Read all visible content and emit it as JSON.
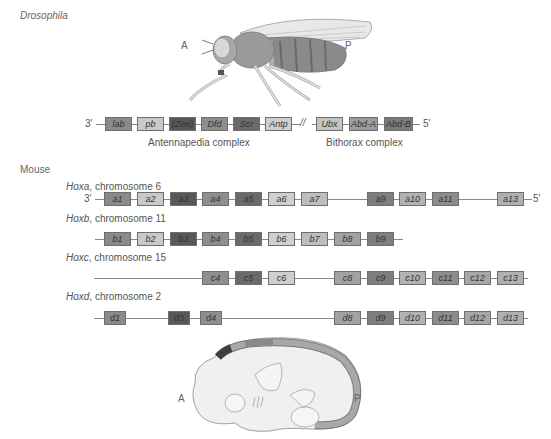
{
  "colors": {
    "lab": "#8a8a8a",
    "pb": "#c9c9c9",
    "zen": "#585858",
    "dfd": "#8e8e8e",
    "scr": "#6a6a6a",
    "antp": "#cfcfcf",
    "ubx": "#c4c4c4",
    "abdA": "#9c9c9c",
    "abdB": "#7a7a7a",
    "g1": "#8a8a8a",
    "g2": "#c9c9c9",
    "g3": "#585858",
    "g4": "#8e8e8e",
    "g5": "#6a6a6a",
    "g6": "#cfcfcf",
    "g7": "#bdbdbd",
    "g8": "#a2a2a2",
    "g9": "#7e7e7e",
    "g10": "#b2b2b2",
    "g11": "#8c8c8c",
    "g12": "#a6a6a6",
    "g13": "#b0b0b0",
    "line": "#888888"
  },
  "drosophila": {
    "title": "Drosophila",
    "anterior_label": "A",
    "posterior_label": "P",
    "end_3": "3′",
    "end_5": "5′",
    "break_mark": "//",
    "genes": [
      {
        "name": "lab",
        "x": 105,
        "color": "#8a8a8a"
      },
      {
        "name": "pb",
        "x": 137,
        "color": "#c9c9c9"
      },
      {
        "name": "(Zen)",
        "x": 169,
        "color": "#585858"
      },
      {
        "name": "Dfd",
        "x": 201,
        "color": "#8e8e8e"
      },
      {
        "name": "Scr",
        "x": 233,
        "color": "#6a6a6a"
      },
      {
        "name": "Antp",
        "x": 265,
        "color": "#cfcfcf"
      },
      {
        "name": "Ubx",
        "x": 316,
        "color": "#c4c4c4"
      },
      {
        "name": "Abd-A",
        "x": 349,
        "color": "#9c9c9c"
      },
      {
        "name": "Abd-B",
        "x": 384,
        "color": "#7a7a7a"
      }
    ],
    "antennapedia_label": "Antennapedia complex",
    "bithorax_label": "Bithorax complex"
  },
  "mouse": {
    "title": "Mouse",
    "end_3": "3′",
    "end_5": "5′",
    "anterior_label": "A",
    "posterior_label": "P",
    "clusters": [
      {
        "name": "Hoxa",
        "chromosome": ", chromosome 6",
        "genes": [
          "a1",
          "a2",
          "a3",
          "a4",
          "a5",
          "a6",
          "a7",
          "",
          "a9",
          "a10",
          "a11",
          "",
          "a13"
        ]
      },
      {
        "name": "Hoxb",
        "chromosome": ", chromosome 11",
        "genes": [
          "b1",
          "b2",
          "b3",
          "b4",
          "b5",
          "b6",
          "b7",
          "b8",
          "b9",
          "",
          "",
          "",
          ""
        ]
      },
      {
        "name": "Hoxc",
        "chromosome": ", chromosome 15",
        "genes": [
          "",
          "",
          "",
          "c4",
          "c5",
          "c6",
          "",
          "c8",
          "c9",
          "c10",
          "c11",
          "c12",
          "c13"
        ]
      },
      {
        "name": "Hoxd",
        "chromosome": ", chromosome 2",
        "genes": [
          "d1",
          "",
          "d3",
          "d4",
          "",
          "",
          "",
          "d8",
          "d9",
          "d10",
          "d11",
          "d12",
          "d13"
        ]
      }
    ]
  }
}
